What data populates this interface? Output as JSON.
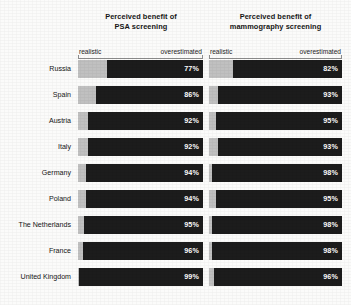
{
  "figure": {
    "background": "#fbfbfa",
    "bar_realistic_color": "#c0c0c0",
    "bar_overestimated_color": "#1c1c1c",
    "value_label_color": "#ffffff"
  },
  "panels": [
    {
      "id": "psa",
      "title_line1": "Perceived benefit of",
      "title_line2": "PSA screening",
      "axis_left_label": "realistic",
      "axis_right_label": "overestimated"
    },
    {
      "id": "mammography",
      "title_line1": "Perceived benefit of",
      "title_line2": "mammography screening",
      "axis_left_label": "realistic",
      "axis_right_label": "overestimated"
    }
  ],
  "categories": [
    "Russia",
    "Spain",
    "Austria",
    "Italy",
    "Germany",
    "Poland",
    "The Netherlands",
    "France",
    "United Kingdom"
  ],
  "values": {
    "psa": [
      "77%",
      "86%",
      "92%",
      "92%",
      "94%",
      "94%",
      "95%",
      "96%",
      "99%"
    ],
    "mammography": [
      "82%",
      "93%",
      "95%",
      "93%",
      "98%",
      "95%",
      "98%",
      "98%",
      "96%"
    ]
  },
  "chart_data": {
    "type": "bar",
    "orientation": "horizontal",
    "stacked": true,
    "xlabel": "",
    "ylabel": "",
    "xlim": [
      0,
      100
    ],
    "grid": false,
    "legend": [
      "realistic",
      "overestimated"
    ],
    "legend_position": "top",
    "categories": [
      "Russia",
      "Spain",
      "Austria",
      "Italy",
      "Germany",
      "Poland",
      "The Netherlands",
      "France",
      "United Kingdom"
    ],
    "panels": [
      {
        "name": "Perceived benefit of PSA screening",
        "series": [
          {
            "name": "overestimated",
            "values": [
              77,
              86,
              92,
              92,
              94,
              94,
              95,
              96,
              99
            ],
            "labels": [
              "77%",
              "86%",
              "92%",
              "92%",
              "94%",
              "94%",
              "95%",
              "96%",
              "99%"
            ]
          },
          {
            "name": "realistic",
            "values": [
              23,
              14,
              8,
              8,
              6,
              6,
              5,
              4,
              1
            ]
          }
        ]
      },
      {
        "name": "Perceived benefit of mammography screening",
        "series": [
          {
            "name": "overestimated",
            "values": [
              82,
              93,
              95,
              93,
              98,
              95,
              98,
              98,
              96
            ],
            "labels": [
              "82%",
              "93%",
              "95%",
              "93%",
              "98%",
              "95%",
              "98%",
              "98%",
              "96%"
            ]
          },
          {
            "name": "realistic",
            "values": [
              18,
              7,
              5,
              7,
              2,
              5,
              2,
              2,
              4
            ]
          }
        ]
      }
    ]
  }
}
